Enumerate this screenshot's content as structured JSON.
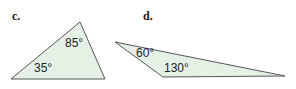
{
  "figures": [
    {
      "label": "c.",
      "shape": "triangle",
      "angles": [
        {
          "value": "85°",
          "position": "top"
        },
        {
          "value": "35°",
          "position": "bottom-left"
        }
      ]
    },
    {
      "label": "d.",
      "shape": "triangle",
      "angles": [
        {
          "value": "60°",
          "position": "left"
        },
        {
          "value": "130°",
          "position": "bottom-left"
        }
      ]
    }
  ],
  "colors": {
    "triangle_fill": "#e6f1e6",
    "triangle_stroke": "#555555",
    "text": "#222222"
  }
}
